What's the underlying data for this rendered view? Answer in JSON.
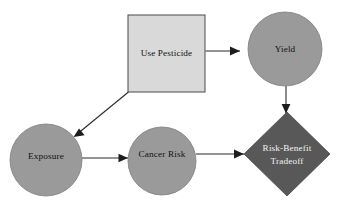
{
  "diagram": {
    "background_color": "#ffffff",
    "nodes": [
      {
        "id": "use-pesticide",
        "label": "Use Pesticide",
        "type": "decision",
        "shape": "rectangle",
        "fill": "#d9d9d9",
        "stroke": "#4a4a4a",
        "text_color": "#111111",
        "x": 128,
        "y": 15,
        "width": 77,
        "height": 77,
        "cx": 166.5,
        "cy": 53.5
      },
      {
        "id": "yield",
        "label": "Yield",
        "type": "chance",
        "shape": "circle",
        "fill": "#9a9a9a",
        "stroke": "#7d7d7d",
        "text_color": "#111111",
        "cx": 285,
        "cy": 49,
        "r": 37
      },
      {
        "id": "exposure",
        "label": "Exposure",
        "type": "chance",
        "shape": "circle",
        "fill": "#9a9a9a",
        "stroke": "#7d7d7d",
        "text_color": "#111111",
        "cx": 46,
        "cy": 160,
        "r": 36
      },
      {
        "id": "cancer-risk",
        "label": "Cancer Risk",
        "type": "chance",
        "shape": "circle",
        "fill": "#9a9a9a",
        "stroke": "#7d7d7d",
        "text_color": "#111111",
        "cx": 162,
        "cy": 161,
        "r": 34
      },
      {
        "id": "risk-benefit-tradeoff",
        "label_line1": "Risk-Benefit",
        "label_line2": "Tradeoff",
        "type": "value",
        "shape": "diamond",
        "fill": "#585858",
        "stroke": "#4a4a4a",
        "text_color": "#f2f2f2",
        "cx": 287,
        "cy": 154,
        "rx": 43,
        "ry": 42
      }
    ],
    "edges": [
      {
        "id": "use-pesticide-to-yield",
        "from": "use-pesticide",
        "to": "yield",
        "direction": "right",
        "label": ""
      },
      {
        "id": "use-pesticide-to-exposure",
        "from": "use-pesticide",
        "to": "exposure",
        "direction": "down-left",
        "label": ""
      },
      {
        "id": "exposure-to-cancer-risk",
        "from": "exposure",
        "to": "cancer-risk",
        "direction": "right",
        "label": ""
      },
      {
        "id": "cancer-risk-to-tradeoff",
        "from": "cancer-risk",
        "to": "risk-benefit-tradeoff",
        "direction": "right",
        "label": ""
      },
      {
        "id": "yield-to-tradeoff",
        "from": "yield",
        "to": "risk-benefit-tradeoff",
        "direction": "down",
        "label": ""
      }
    ]
  }
}
